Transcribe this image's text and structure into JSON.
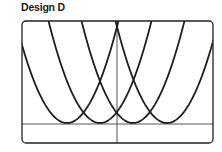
{
  "title": "Design D",
  "chart_data": {
    "type": "line",
    "title": "Design D",
    "series": [
      {
        "name": "parabola-1",
        "vertex_x_px": 67
      },
      {
        "name": "parabola-2",
        "vertex_x_px": 100
      },
      {
        "name": "parabola-3",
        "vertex_x_px": 133
      },
      {
        "name": "parabola-4",
        "vertex_x_px": 167
      }
    ],
    "axes": {
      "x_axis_y_px": 124,
      "y_axis_x_px": 117
    },
    "grid": false
  },
  "colors": {
    "curve": "#1e1e1e",
    "axis": "#555555",
    "frame": "#222222"
  }
}
